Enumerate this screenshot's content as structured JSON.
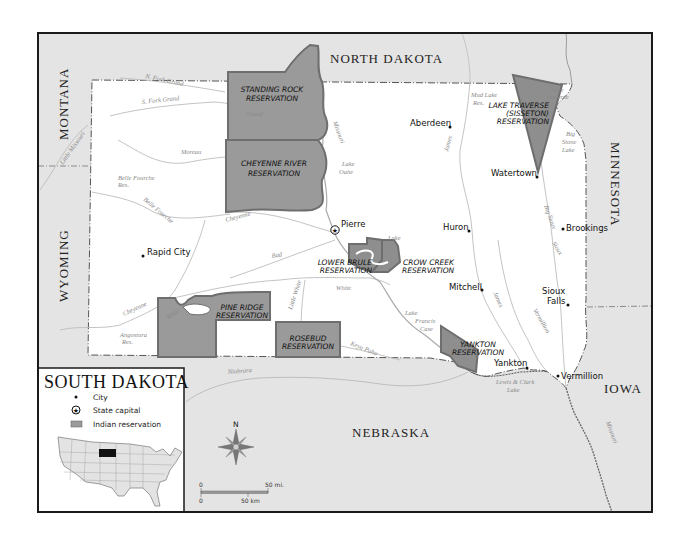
{
  "map": {
    "title": "SOUTH DAKOTA",
    "colors": {
      "background": "#ffffff",
      "neighbor_fill": "#e4e4e4",
      "state_fill": "#ffffff",
      "reservation_fill": "#9a9a9a",
      "reservation_border": "#6e6e6e",
      "river": "#b5b5b5",
      "frame": "#1a1a1a",
      "highlight_state": "#111111"
    },
    "neighbors": [
      {
        "name": "NORTH DAKOTA"
      },
      {
        "name": "MONTANA"
      },
      {
        "name": "WYOMING"
      },
      {
        "name": "MINNESOTA"
      },
      {
        "name": "IOWA"
      },
      {
        "name": "NEBRASKA"
      }
    ],
    "reservations": [
      {
        "line1": "STANDING ROCK",
        "line2": "RESERVATION"
      },
      {
        "line1": "CHEYENNE RIVER",
        "line2": "RESERVATION"
      },
      {
        "line1": "LAKE TRAVERSE",
        "line2": "(SISSETON)",
        "line3": "RESERVATION"
      },
      {
        "line1": "LOWER BRULE",
        "line2": "RESERVATION"
      },
      {
        "line1": "CROW CREEK",
        "line2": "RESERVATION"
      },
      {
        "line1": "PINE RIDGE",
        "line2": "RESERVATION"
      },
      {
        "line1": "ROSEBUD",
        "line2": "RESERVATION"
      },
      {
        "line1": "YANKTON",
        "line2": "RESERVATION"
      }
    ],
    "cities": [
      {
        "name": "Aberdeen",
        "type": "city"
      },
      {
        "name": "Watertown",
        "type": "city"
      },
      {
        "name": "Brookings",
        "type": "city"
      },
      {
        "name": "Pierre",
        "type": "capital"
      },
      {
        "name": "Huron",
        "type": "city"
      },
      {
        "name": "Rapid City",
        "type": "city"
      },
      {
        "name": "Mitchell",
        "type": "city"
      },
      {
        "name": "Sioux",
        "name2": "Falls",
        "type": "city"
      },
      {
        "name": "Yankton",
        "type": "city"
      },
      {
        "name": "Vermillion",
        "type": "city"
      }
    ],
    "water": [
      {
        "name": "N. Fork Grand"
      },
      {
        "name": "S. Fork Grand"
      },
      {
        "name": "Grand"
      },
      {
        "name": "Little Missouri"
      },
      {
        "name": "Moreau"
      },
      {
        "name": "Belle Fourche",
        "name2": "Res."
      },
      {
        "name": "Belle Fourche"
      },
      {
        "name": "Cheyenne"
      },
      {
        "name": "Missouri"
      },
      {
        "name": "Lake",
        "name2": "Oahe"
      },
      {
        "name": "Mud Lake",
        "name2": "Res."
      },
      {
        "name": "James"
      },
      {
        "name": "Lake",
        "name2": "Traverse"
      },
      {
        "name": "Big",
        "name2": "Stone",
        "name3": "Lake"
      },
      {
        "name": "Big Sioux"
      },
      {
        "name": "Bad"
      },
      {
        "name": "Lake",
        "name2": "Sharpe"
      },
      {
        "name": "White"
      },
      {
        "name": "Cheyenne"
      },
      {
        "name": "Angostura",
        "name2": "Res."
      },
      {
        "name": "White"
      },
      {
        "name": "Little White"
      },
      {
        "name": "Keya Paha"
      },
      {
        "name": "Lake",
        "name2": "Francis",
        "name3": "Case"
      },
      {
        "name": "James"
      },
      {
        "name": "Vermillion"
      },
      {
        "name": "Sioux"
      },
      {
        "name": "Niobrara"
      },
      {
        "name": "Lewis & Clark",
        "name2": "Lake"
      },
      {
        "name": "Missouri"
      }
    ],
    "legend": {
      "title": "SOUTH DAKOTA",
      "items": [
        {
          "symbol": "dot",
          "label": "City"
        },
        {
          "symbol": "star-circle",
          "label": "State capital"
        },
        {
          "symbol": "gray-rect",
          "label": "Indian reservation"
        }
      ]
    },
    "compass": {
      "north_label": "N"
    },
    "scale": {
      "mi_zero": "0",
      "mi_label": "50 mi.",
      "km_zero": "0",
      "km_label": "50 km"
    }
  }
}
